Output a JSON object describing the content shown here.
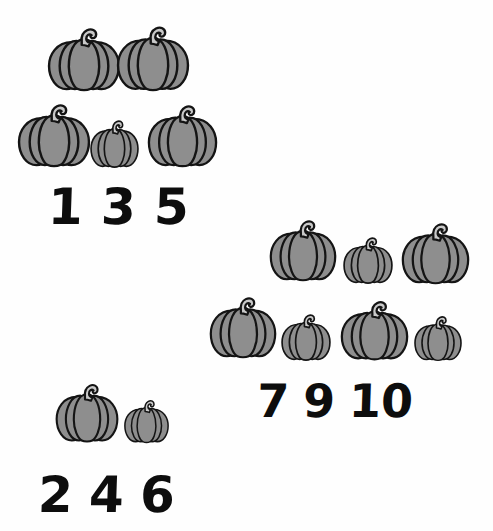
{
  "worksheet": {
    "title": "Pumpkin counting worksheet",
    "background_color": "#fefefe",
    "pumpkin_fill": "#8e8e8e",
    "pumpkin_outline": "#141414",
    "pumpkin_stem_fill": "#c9c9c9",
    "number_color": "#0d0d0d"
  },
  "groups": [
    {
      "id": "group-top-left",
      "pumpkin_count": 5,
      "number_row": {
        "id": "row-135",
        "numbers": [
          "1",
          "3",
          "5"
        ]
      },
      "pumpkins": [
        {
          "name": "pumpkin-1",
          "x": 46,
          "y": 24,
          "w": 76,
          "h": 70,
          "size": "large"
        },
        {
          "name": "pumpkin-2",
          "x": 115,
          "y": 22,
          "w": 76,
          "h": 72,
          "size": "large"
        },
        {
          "name": "pumpkin-3",
          "x": 16,
          "y": 100,
          "w": 76,
          "h": 70,
          "size": "large"
        },
        {
          "name": "pumpkin-4",
          "x": 89,
          "y": 117,
          "w": 51,
          "h": 53,
          "size": "small"
        },
        {
          "name": "pumpkin-5",
          "x": 146,
          "y": 101,
          "w": 73,
          "h": 69,
          "size": "large"
        }
      ]
    },
    {
      "id": "group-right",
      "pumpkin_count": 7,
      "number_row": {
        "id": "row-7-9-10",
        "numbers": [
          "7",
          "9",
          "10"
        ]
      },
      "pumpkins": [
        {
          "name": "pumpkin-1",
          "x": 268,
          "y": 216,
          "w": 70,
          "h": 68,
          "size": "large"
        },
        {
          "name": "pumpkin-2",
          "x": 342,
          "y": 234,
          "w": 52,
          "h": 52,
          "size": "small"
        },
        {
          "name": "pumpkin-3",
          "x": 400,
          "y": 219,
          "w": 71,
          "h": 68,
          "size": "large"
        },
        {
          "name": "pumpkin-4",
          "x": 208,
          "y": 293,
          "w": 70,
          "h": 68,
          "size": "large"
        },
        {
          "name": "pumpkin-5",
          "x": 280,
          "y": 311,
          "w": 52,
          "h": 52,
          "size": "small"
        },
        {
          "name": "pumpkin-6",
          "x": 339,
          "y": 297,
          "w": 71,
          "h": 66,
          "size": "large"
        },
        {
          "name": "pumpkin-7",
          "x": 413,
          "y": 313,
          "w": 50,
          "h": 50,
          "size": "small"
        }
      ]
    },
    {
      "id": "group-bottom-left",
      "pumpkin_count": 2,
      "number_row": {
        "id": "row-246",
        "numbers": [
          "2",
          "4",
          "6"
        ]
      },
      "pumpkins": [
        {
          "name": "pumpkin-1",
          "x": 54,
          "y": 380,
          "w": 66,
          "h": 65,
          "size": "large"
        },
        {
          "name": "pumpkin-2",
          "x": 123,
          "y": 397,
          "w": 47,
          "h": 48,
          "size": "small"
        }
      ]
    }
  ]
}
